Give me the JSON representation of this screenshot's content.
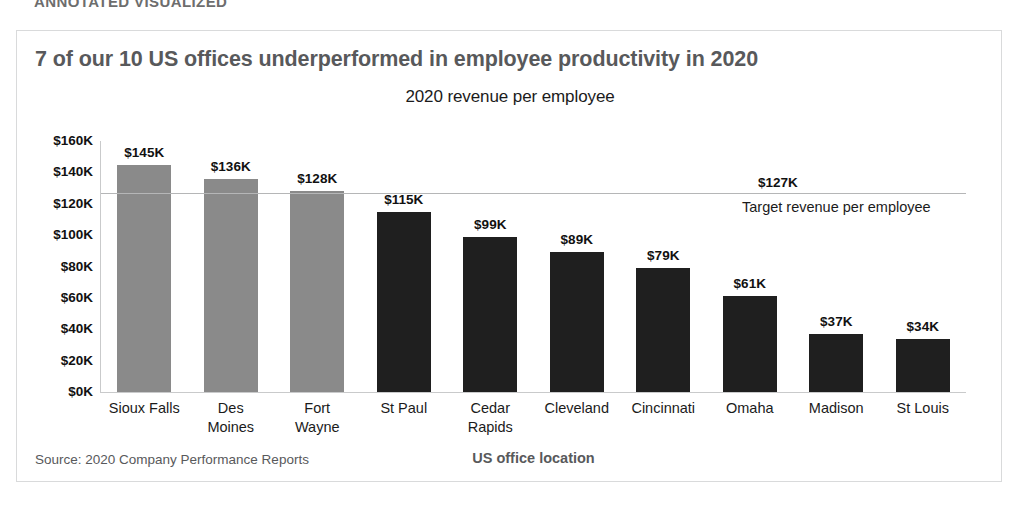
{
  "top_strip": {
    "text": "ANNOTATED VISUALIZED"
  },
  "card": {
    "title": "7 of our 10 US offices underperformed in employee productivity in 2020",
    "source": "Source: 2020 Company Performance Reports"
  },
  "colors": {
    "above_target_bar": "#8a8a8a",
    "below_target_bar": "#1f1f1f",
    "title_text": "#58595b",
    "axis_line": "#c9cacb",
    "target_line": "#b5b6b7",
    "card_border": "#d9dadb"
  },
  "chart_data": {
    "type": "bar",
    "title": "7 of our 10 US offices underperformed in employee productivity in 2020",
    "subtitle": "2020 revenue per employee",
    "xlabel": "US office location",
    "ylabel": "",
    "ylim": [
      0,
      160
    ],
    "yticks": [
      160,
      140,
      120,
      100,
      80,
      60,
      40,
      20,
      0
    ],
    "ytick_labels": [
      "$160K",
      "$140K",
      "$120K",
      "$100K",
      "$80K",
      "$60K",
      "$40K",
      "$20K",
      "$0K"
    ],
    "grid": false,
    "legend": "none",
    "units": "thousands of USD",
    "categories": [
      "Sioux Falls",
      "Des Moines",
      "Fort Wayne",
      "St Paul",
      "Cedar Rapids",
      "Cleveland",
      "Cincinnati",
      "Omaha",
      "Madison",
      "St Louis"
    ],
    "category_lines": [
      [
        "Sioux Falls"
      ],
      [
        "Des",
        "Moines"
      ],
      [
        "Fort",
        "Wayne"
      ],
      [
        "St Paul"
      ],
      [
        "Cedar",
        "Rapids"
      ],
      [
        "Cleveland"
      ],
      [
        "Cincinnati"
      ],
      [
        "Omaha"
      ],
      [
        "Madison"
      ],
      [
        "St Louis"
      ]
    ],
    "values": [
      145,
      136,
      128,
      115,
      99,
      89,
      79,
      61,
      37,
      34
    ],
    "value_labels": [
      "$145K",
      "$136K",
      "$128K",
      "$115K",
      "$99K",
      "$89K",
      "$79K",
      "$61K",
      "$37K",
      "$34K"
    ],
    "bar_states": [
      "above",
      "above",
      "above",
      "below",
      "below",
      "below",
      "below",
      "below",
      "below",
      "below"
    ],
    "annotations": [
      {
        "type": "reference_line",
        "value": 127,
        "value_label": "$127K",
        "caption": "Target revenue per employee"
      }
    ]
  }
}
